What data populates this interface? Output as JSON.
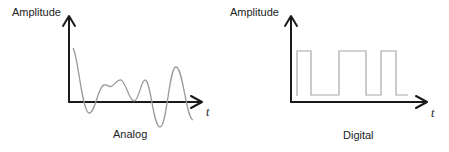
{
  "panels": [
    {
      "id": "analog",
      "y_axis_label": "Amplitude",
      "x_axis_label": "t",
      "caption": "Analog",
      "signal_type": "continuous wave"
    },
    {
      "id": "digital",
      "y_axis_label": "Amplitude",
      "x_axis_label": "t",
      "caption": "Digital",
      "signal_type": "square wave"
    }
  ],
  "colors": {
    "axis": "#1a1a1a",
    "signal": "#9a9a9a",
    "text": "#222222",
    "background": "#ffffff"
  }
}
